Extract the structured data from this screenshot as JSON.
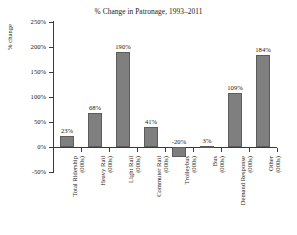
{
  "chart_data": {
    "type": "bar",
    "title": "% Change in Patronage, 1993–2011",
    "xlabel": "",
    "ylabel": "% change",
    "ylim": [
      -50,
      250
    ],
    "ytick_values": [
      250,
      200,
      150,
      100,
      50,
      0,
      -50
    ],
    "ytick_labels": [
      "250%",
      "200%",
      "150%",
      "100%",
      "50%",
      "0%",
      "-50%"
    ],
    "grid": false,
    "legend": "none",
    "categories": [
      "Total Ridership",
      "Heavy Rail",
      "Light Rail",
      "Commuter Rail",
      "Trolleybus",
      "Bus",
      "Demand Response",
      "Other"
    ],
    "category_units": [
      "(000s)",
      "(000s)",
      "(000s)",
      "(000s)",
      "(000s)",
      "(000s)",
      "(000s)",
      "(000s)"
    ],
    "values": [
      23,
      68,
      190,
      41,
      -20,
      3,
      109,
      184
    ],
    "value_labels": [
      "23%",
      "68%",
      "190%",
      "41%",
      "-20%",
      "3%",
      "109%",
      "184%"
    ],
    "bar_color": "#7f7f7f",
    "bar_edge_color": "#5c5c5c",
    "axis_color": "#3a3a3a"
  }
}
